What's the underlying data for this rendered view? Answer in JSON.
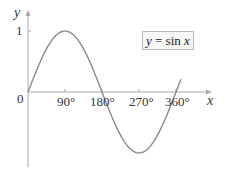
{
  "chart_data": {
    "type": "line",
    "title": "",
    "xlabel": "x",
    "ylabel": "y",
    "legend": "y = sin x",
    "legend_position": "upper-right",
    "x_ticks": [
      "0",
      "90°",
      "180°",
      "270°",
      "360°"
    ],
    "y_ticks": [
      "1"
    ],
    "xlim": [
      0,
      400
    ],
    "ylim": [
      -1.2,
      1.3
    ],
    "grid": false,
    "series": [
      {
        "name": "y = sin x",
        "x": [
          0,
          30,
          60,
          90,
          120,
          150,
          180,
          210,
          240,
          270,
          300,
          330,
          360
        ],
        "values": [
          0,
          0.5,
          0.866,
          1,
          0.866,
          0.5,
          0,
          -0.5,
          -0.866,
          -1,
          -0.866,
          -0.5,
          0
        ]
      }
    ]
  },
  "labels": {
    "y_axis": "y",
    "x_axis": "x",
    "one": "1",
    "origin": "0",
    "t90": "90°",
    "t180": "180°",
    "t270": "270°",
    "t360": "360°",
    "legend_lhs": "y",
    "legend_eq": " = sin ",
    "legend_rhs": "x"
  },
  "colors": {
    "axis": "#a8a8a8",
    "curve": "#8a8a8a",
    "text": "#333333"
  }
}
